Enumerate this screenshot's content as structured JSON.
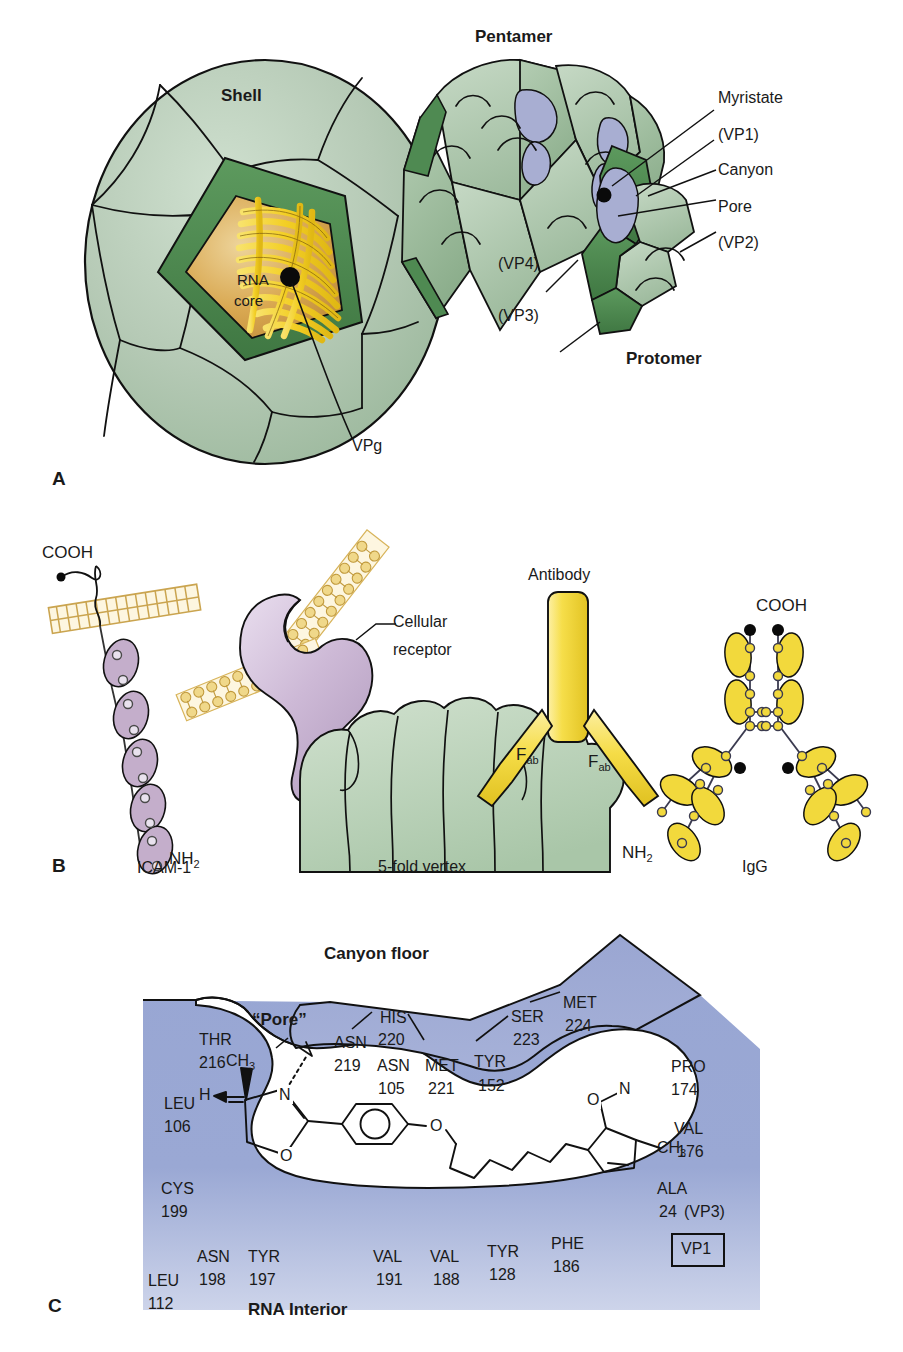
{
  "figure": {
    "background_color": "#ffffff",
    "palette": {
      "shell_light_green": "#b8ccb8",
      "shell_mid_green": "#9cbb9c",
      "shell_dark_green": "#4f8a52",
      "canyon_lavender": "#a8aed2",
      "rna_yellow": "#f5d32e",
      "rna_core_tan": "#d9a851",
      "receptor_mauve": "#c4aecb",
      "antibody_yellow": "#f2d93c",
      "membrane_gold": "#d8b45a",
      "panelC_blue": "#9aa8d4",
      "panelC_blue_light": "#c3cbe6",
      "outline": "#111111"
    }
  },
  "panel_a": {
    "letter": "A",
    "labels": {
      "shell": "Shell",
      "pentamer": "Pentamer",
      "protomer": "Protomer",
      "rna_core_line1": "RNA",
      "rna_core_line2": "core",
      "vpg": "VPg",
      "myristate": "Myristate",
      "vp1": "(VP1)",
      "canyon": "Canyon",
      "pore": "Pore",
      "vp2": "(VP2)",
      "vp3": "(VP3)",
      "vp4": "(VP4)"
    }
  },
  "panel_b": {
    "letter": "B",
    "labels": {
      "cooh_left": "COOH",
      "nh2_left": "NH",
      "nh2_left_sub": "2",
      "icam1": "ICAM-1",
      "cellular_receptor_line1": "Cellular",
      "cellular_receptor_line2": "receptor",
      "five_fold_vertex": "5-fold vertex",
      "antibody": "Antibody",
      "fab_left": "F",
      "fab_left_sub": "ab",
      "fab_right": "F",
      "fab_right_sub": "ab",
      "cooh_right": "COOH",
      "nh2_right": "NH",
      "nh2_right_sub": "2",
      "igg": "IgG"
    }
  },
  "panel_c": {
    "letter": "C",
    "labels": {
      "canyon_floor": "Canyon floor",
      "pore": "“Pore”",
      "rna_interior": "RNA Interior",
      "vp1_box": "VP1"
    },
    "residues": {
      "left_wall": [
        {
          "name": "THR",
          "number": "216"
        },
        {
          "name": "LEU",
          "number": "106"
        },
        {
          "name": "CYS",
          "number": "199"
        },
        {
          "name": "LEU",
          "number": "112"
        }
      ],
      "top_lobe": [
        {
          "name": "ASN",
          "number": "219"
        },
        {
          "name": "HIS",
          "number": "220"
        },
        {
          "name": "ASN",
          "number": "105"
        },
        {
          "name": "MET",
          "number": "221"
        },
        {
          "name": "TYR",
          "number": "152"
        },
        {
          "name": "SER",
          "number": "223"
        },
        {
          "name": "MET",
          "number": "224"
        }
      ],
      "right_wall": [
        {
          "name": "PRO",
          "number": "174"
        },
        {
          "name": "VAL",
          "number": "176"
        },
        {
          "name": "ALA",
          "number": "24",
          "chain": "(VP3)"
        }
      ],
      "bottom_floor": [
        {
          "name": "ASN",
          "number": "198"
        },
        {
          "name": "TYR",
          "number": "197"
        },
        {
          "name": "VAL",
          "number": "191"
        },
        {
          "name": "VAL",
          "number": "188"
        },
        {
          "name": "TYR",
          "number": "128"
        },
        {
          "name": "PHE",
          "number": "186"
        }
      ]
    },
    "chemical_structure": {
      "name": "WIN antiviral compound",
      "atom_labels": [
        "CH",
        "3",
        "H",
        "N",
        "O",
        "O",
        "O",
        "N",
        "CH",
        "3"
      ],
      "methyl_left": "CH",
      "methyl_left_sub": "3",
      "hydrogen": "H",
      "nitrogen_oxazoline": "N",
      "oxygen_oxazoline": "O",
      "ether_oxygen": "O",
      "isoxazole_oxygen": "O",
      "isoxazole_nitrogen": "N",
      "methyl_right": "CH",
      "methyl_right_sub": "3"
    }
  }
}
